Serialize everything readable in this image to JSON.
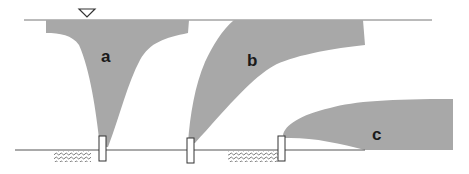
{
  "diagram": {
    "type": "schematic cross-section",
    "colors": {
      "plume_fill": "#a8a8a8",
      "line": "#555555",
      "background": "#ffffff"
    },
    "surface_line": {
      "symbol": "water-table-triangle"
    },
    "plumes": [
      {
        "id": "a",
        "label": "a"
      },
      {
        "id": "b",
        "label": "b"
      },
      {
        "id": "c",
        "label": "c"
      }
    ],
    "wells": 3,
    "hatched_zones": 2
  }
}
